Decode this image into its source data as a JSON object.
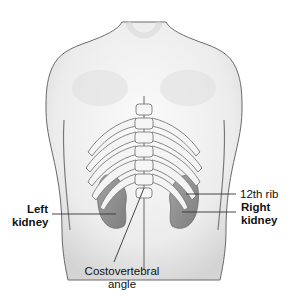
{
  "figure": {
    "labels": {
      "left_kidney": [
        "Left",
        "kidney"
      ],
      "right_kidney": [
        "Right",
        "kidney"
      ],
      "twelfth_rib": "12th rib",
      "costovertebral_angle": [
        "Costovertebral",
        "angle"
      ]
    }
  },
  "colors": {
    "background": "#ffffff",
    "skin_outline": "#6a6a6a",
    "skin_shade": "#e6e6e6",
    "bone": "#f4f4f4",
    "bone_outline": "#7a7a7a",
    "kidney": "#8f8f8f",
    "leader_line": "#333333",
    "text": "#111111"
  }
}
